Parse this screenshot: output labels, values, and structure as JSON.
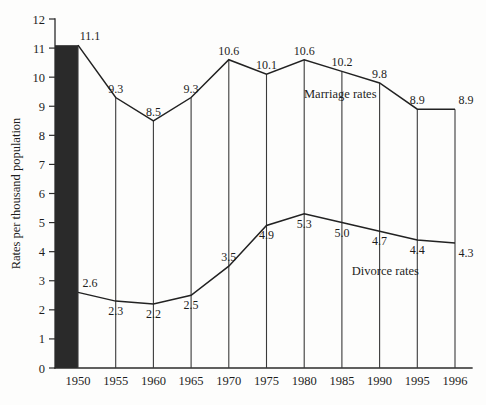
{
  "chart_data": {
    "type": "line",
    "title": "",
    "subtitle": "",
    "xlabel": "",
    "ylabel": "Rates per thousand population",
    "categories": [
      "1950",
      "1955",
      "1960",
      "1965",
      "1970",
      "1975",
      "1980",
      "1985",
      "1990",
      "1995",
      "1996"
    ],
    "x": [
      1950,
      1955,
      1960,
      1965,
      1970,
      1975,
      1980,
      1985,
      1990,
      1995,
      1996
    ],
    "ylim": [
      0,
      12
    ],
    "xlim": [
      1950,
      1996
    ],
    "yticks": [
      0,
      1,
      2,
      3,
      4,
      5,
      6,
      7,
      8,
      9,
      10,
      11,
      12
    ],
    "ytick_labels": [
      "0",
      "1",
      "2",
      "3",
      "4",
      "5",
      "6",
      "7",
      "8",
      "9",
      "10",
      "11",
      "12"
    ],
    "grid": false,
    "legend_position": "inline-annotation",
    "series": [
      {
        "name": "Marriage rates",
        "values": [
          11.1,
          9.3,
          8.5,
          9.3,
          10.6,
          10.1,
          10.6,
          10.2,
          9.8,
          8.9,
          8.9
        ],
        "labels": [
          "11.1",
          "9.3",
          "8.5",
          "9.3",
          "10.6",
          "10.1",
          "10.6",
          "10.2",
          "9.8",
          "8.9",
          "8.9"
        ],
        "label_side": [
          "above",
          "above",
          "above",
          "above",
          "above",
          "above",
          "above",
          "above",
          "above",
          "above",
          "above"
        ],
        "color": "#222222"
      },
      {
        "name": "Divorce rates",
        "values": [
          2.6,
          2.3,
          2.2,
          2.5,
          3.5,
          4.9,
          5.3,
          5.0,
          4.7,
          4.4,
          4.3
        ],
        "labels": [
          "2.6",
          "2.3",
          "2.2",
          "2.5",
          "3.5",
          "4.9",
          "5.3",
          "5.0",
          "4.7",
          "4.4",
          "4.3"
        ],
        "label_side": [
          "above",
          "below",
          "below",
          "below",
          "above",
          "below",
          "below",
          "below",
          "below",
          "below",
          "below"
        ],
        "color": "#222222"
      }
    ],
    "annotations": [
      {
        "text": "Marriage rates",
        "x": 1982,
        "y": 9.3
      },
      {
        "text": "Divorce rates",
        "x": 1987.5,
        "y": 3.2
      }
    ],
    "accent_color": "#2a2a2a",
    "background_color": "#fdfdfc",
    "shaded_column": {
      "from": "1950",
      "to": "1950",
      "note": "solid black vertical band at 1950 between divorce and marriage values"
    }
  }
}
